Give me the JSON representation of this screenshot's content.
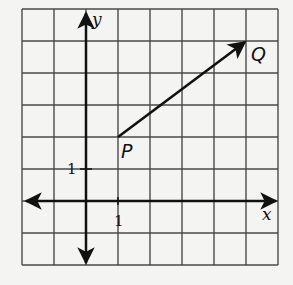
{
  "diagram": {
    "type": "coordinate-grid-vector",
    "grid": {
      "x_min": -2,
      "x_max": 6,
      "y_min": -2,
      "y_max": 6,
      "cell_px": 32,
      "origin_px": [
        86,
        201
      ],
      "left_px": 22,
      "top_px": 9,
      "line_color": "#4a4a4a",
      "axis_color": "#111111"
    },
    "axes": {
      "x_label": "x",
      "y_label": "y",
      "x_tick_label": "1",
      "y_tick_label": "1"
    },
    "points": [
      {
        "name": "P",
        "label": "P",
        "x": 1,
        "y": 2
      },
      {
        "name": "Q",
        "label": "Q",
        "x": 5,
        "y": 5
      }
    ],
    "vector": {
      "from": "P",
      "to": "Q",
      "color": "#111111"
    }
  }
}
